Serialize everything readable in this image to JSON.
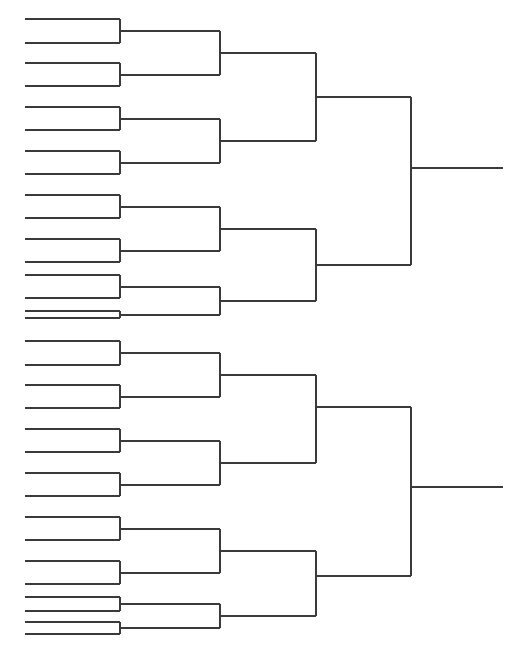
{
  "document": {
    "title": "Tournament Bracket",
    "type": "single-elimination-bracket",
    "width": 522,
    "height": 658,
    "background_color": "#ffffff",
    "line_color": "#3a3a3a",
    "line_width": 1.1,
    "description": "Blank 32-slot single elimination tournament bracket, left-to-right, 5 connector rounds ending in two champion lines (upper half and lower half)."
  },
  "chart_data": {
    "type": "diagram",
    "title": "",
    "subtitle": "",
    "xlabel": "",
    "ylabel": "",
    "grid": false,
    "legend": null,
    "structure": {
      "orientation": "left-to-right",
      "total_entry_slots": 32,
      "halves": 2,
      "slots_per_half": 16,
      "rounds": [
        {
          "index": 0,
          "name": "round-of-32-entry-lines",
          "entries": 32,
          "x_start": 25,
          "x_end": 120
        },
        {
          "index": 1,
          "name": "round-of-16",
          "entries": 16,
          "x_start": 120,
          "x_end": 220
        },
        {
          "index": 2,
          "name": "quarterfinals-region",
          "entries": 8,
          "x_start": 220,
          "x_end": 316
        },
        {
          "index": 3,
          "name": "semifinals-region",
          "entries": 4,
          "x_start": 316,
          "x_end": 411
        },
        {
          "index": 4,
          "name": "final-lines",
          "entries": 2,
          "x_start": 411,
          "x_end": 503
        }
      ]
    },
    "geometry": {
      "entry_x_start": 25,
      "connector_x": [
        120,
        220,
        316,
        411
      ],
      "final_x_end": 503,
      "entry_rows_top_half_y": [
        19,
        43,
        63,
        86,
        107,
        130,
        151,
        174,
        195,
        218,
        239,
        262,
        274,
        297,
        318,
        318
      ],
      "half_offset_y": 322
    },
    "slot_labels": [],
    "values": []
  },
  "accessibility": {
    "alt_text": "Empty 32-team single elimination tournament bracket chart with blank lines for writing team names."
  }
}
